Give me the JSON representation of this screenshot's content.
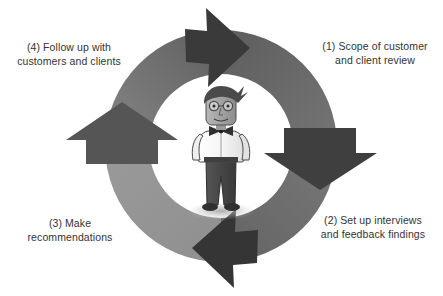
{
  "diagram": {
    "type": "cyclical-process-diagram",
    "title": "",
    "center_figure": {
      "name": "businessman-illustration",
      "description": "cartoon man with spiky hair, glasses, bow tie, white shirt and dark trousers"
    },
    "ring": {
      "segment_count": 4,
      "direction": "clockwise",
      "color_dark": "#4a4a4a",
      "color_mid": "#6e6e6e",
      "color_light": "#8e8e8e",
      "arrow_color": "#3c3c3c"
    },
    "steps": [
      {
        "number": "(1)",
        "label": "(1) Scope of customer\nand client review",
        "position": "top-right",
        "arrow": "arrow-top-right"
      },
      {
        "number": "(2)",
        "label": "(2) Set up interviews\nand feedback findings",
        "position": "bottom-right",
        "arrow": "arrow-bottom-right"
      },
      {
        "number": "(3)",
        "label": "(3) Make\nrecommendations",
        "position": "bottom-left",
        "arrow": "arrow-bottom-left"
      },
      {
        "number": "(4)",
        "label": "(4) Follow up with\ncustomers and clients",
        "position": "top-left",
        "arrow": "arrow-top-left"
      }
    ]
  }
}
